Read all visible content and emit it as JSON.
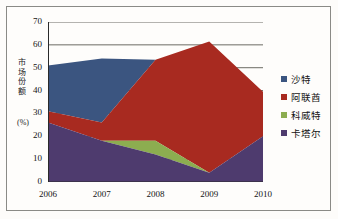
{
  "chart_data": {
    "type": "area",
    "stacked": true,
    "title": "",
    "subtitle": "",
    "xlabel": "",
    "ylabel": "市场份额",
    "ylabel_unit": "(%)",
    "ylabel_chars": [
      "市",
      "场",
      "份",
      "额"
    ],
    "categories": [
      "2006",
      "2007",
      "2008",
      "2009",
      "2010"
    ],
    "x": [
      2006,
      2007,
      2008,
      2009,
      2010
    ],
    "ylim": [
      0,
      70
    ],
    "yticks": [
      0,
      10,
      20,
      30,
      40,
      50,
      60,
      70
    ],
    "ytick_labels": [
      "0",
      "10",
      "20",
      "30",
      "40",
      "50",
      "60",
      "70"
    ],
    "grid": true,
    "grid_axis": "y",
    "legend_position": "right",
    "series": [
      {
        "name": "卡塔尔",
        "color": "#4E3B6E",
        "values": [
          26,
          18,
          12,
          4,
          20
        ]
      },
      {
        "name": "科威特",
        "color": "#8CAD50",
        "values": [
          0,
          0,
          6,
          0,
          0
        ]
      },
      {
        "name": "阿联酋",
        "color": "#A82A20",
        "values": [
          5,
          8,
          35.5,
          57.5,
          19.5
        ]
      },
      {
        "name": "沙特",
        "color": "#3B5580",
        "values": [
          20,
          28,
          0,
          0,
          0
        ]
      }
    ],
    "stack_tops": {
      "卡塔尔": [
        26,
        18,
        12,
        4,
        20
      ],
      "科威特": [
        26,
        18,
        18,
        4,
        20
      ],
      "阿联酋": [
        31,
        26,
        53.5,
        61.5,
        39.5
      ],
      "沙特": [
        51,
        54,
        53.5,
        61.5,
        39.5
      ]
    },
    "annotations": []
  },
  "legend": {
    "items": [
      {
        "label": "沙特",
        "color": "#3B5580"
      },
      {
        "label": "阿联酋",
        "color": "#A82A20"
      },
      {
        "label": "科威特",
        "color": "#8CAD50"
      },
      {
        "label": "卡塔尔",
        "color": "#4E3B6E"
      }
    ]
  },
  "colors": {
    "blue": "#3B5580",
    "red": "#A82A20",
    "green": "#8CAD50",
    "purple": "#4E3B6E",
    "grid": "#6b6b64",
    "frame": "#8a8a86",
    "background": "#fefdfb",
    "text": "#141414"
  }
}
